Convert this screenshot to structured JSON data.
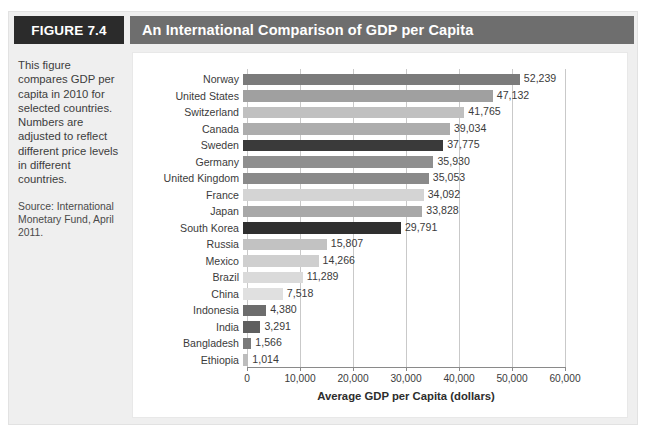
{
  "header": {
    "figure_tag": "FIGURE 7.4",
    "title": "An International Comparison of GDP per Capita"
  },
  "caption": {
    "body": "This figure compares GDP per capita in 2010 for selected countries. Numbers are adjusted to reflect different price levels in different countries.",
    "source": "Source: International Monetary Fund, April 2011."
  },
  "chart_data": {
    "type": "bar",
    "orientation": "horizontal",
    "title": "An International Comparison of GDP per Capita",
    "xlabel": "Average GDP per Capita (dollars)",
    "ylabel": "",
    "xlim": [
      0,
      60000
    ],
    "xticks": [
      0,
      10000,
      20000,
      30000,
      40000,
      50000,
      60000
    ],
    "xtick_labels": [
      "0",
      "10,000",
      "20,000",
      "30,000",
      "40,000",
      "50,000",
      "60,000"
    ],
    "grid": true,
    "grid_axis": "x",
    "legend": false,
    "categories": [
      "Norway",
      "United States",
      "Switzerland",
      "Canada",
      "Sweden",
      "Germany",
      "United Kingdom",
      "France",
      "Japan",
      "South Korea",
      "Russia",
      "Mexico",
      "Brazil",
      "China",
      "Indonesia",
      "India",
      "Bangladesh",
      "Ethiopia"
    ],
    "values": [
      52239,
      47132,
      41765,
      39034,
      37775,
      35930,
      35053,
      34092,
      33828,
      29791,
      15807,
      14266,
      11289,
      7518,
      4380,
      3291,
      1566,
      1014
    ],
    "value_labels": [
      "52,239",
      "47,132",
      "41,765",
      "39,034",
      "37,775",
      "35,930",
      "35,053",
      "34,092",
      "33,828",
      "29,791",
      "15,807",
      "14,266",
      "11,289",
      "7,518",
      "4,380",
      "3,291",
      "1,566",
      "1,014"
    ],
    "bar_colors": [
      "#7b7b7b",
      "#a0a0a0",
      "#c0c0c0",
      "#adadad",
      "#3a3a3a",
      "#8f8f8f",
      "#8a8a8a",
      "#d4d4d4",
      "#a8a8a8",
      "#2f2f2f",
      "#c2c2c2",
      "#cfcfcf",
      "#dadada",
      "#e0e0e0",
      "#6d6d6d",
      "#5f5f5f",
      "#7a7a7a",
      "#bdbdbd"
    ]
  },
  "colors": {
    "figure_tag_bg": "#2b2b2b",
    "title_bg": "#6e6e6e",
    "panel_bg": "#efefef",
    "chart_bg": "#ffffff",
    "grid": "#c9c9c9",
    "axis": "#8a8a8a",
    "text": "#3b3b3b"
  }
}
